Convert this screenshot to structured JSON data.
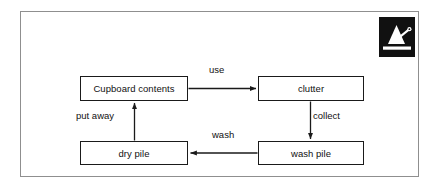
{
  "page": {
    "background_color": "#ffffff",
    "frame_border_color": "#8f8f8f"
  },
  "logo": {
    "name": "metronome-logo",
    "background_color": "#111111",
    "mark_color": "#ffffff"
  },
  "diagram": {
    "title": "",
    "line_color": "#1a1a1a",
    "nodes": [
      {
        "id": "cupboard",
        "label": "Cupboard contents"
      },
      {
        "id": "clutter",
        "label": "clutter"
      },
      {
        "id": "drypile",
        "label": "dry pile"
      },
      {
        "id": "washpile",
        "label": "wash pile"
      }
    ],
    "edges": [
      {
        "id": "use",
        "label": "use",
        "from": "cupboard",
        "to": "clutter",
        "direction": "right"
      },
      {
        "id": "collect",
        "label": "collect",
        "from": "clutter",
        "to": "washpile",
        "direction": "down"
      },
      {
        "id": "wash",
        "label": "wash",
        "from": "washpile",
        "to": "drypile",
        "direction": "left"
      },
      {
        "id": "put_away",
        "label": "put away",
        "from": "drypile",
        "to": "cupboard",
        "direction": "up"
      }
    ]
  }
}
